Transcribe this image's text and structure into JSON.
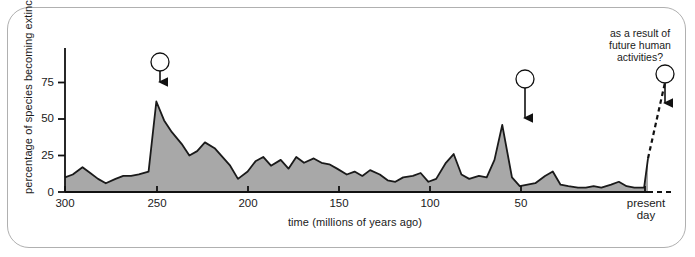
{
  "figure": {
    "border_color": "#b0b0b0"
  },
  "axes": {
    "ylabel": "percentage of species becoming extinct",
    "xlabel": "time (millions of years ago)",
    "yticks": [
      "0",
      "25",
      "50",
      "75"
    ],
    "xticks": [
      "300",
      "250",
      "200",
      "150",
      "100",
      "50"
    ],
    "x_end_label_line1": "present",
    "x_end_label_line2": "day"
  },
  "annotations": {
    "future_note_line1": "as a result of",
    "future_note_line2": "future human",
    "future_note_line3": "activities?",
    "marker1": "1",
    "marker2": "2",
    "marker3": "3"
  },
  "chart_data": {
    "type": "area",
    "title": "",
    "xlabel": "time (millions of years ago)",
    "ylabel": "percentage of species becoming extinct",
    "xlim": [
      300,
      0
    ],
    "ylim": [
      0,
      88
    ],
    "grid": false,
    "legend": "none",
    "x_axis_direction": "reversed",
    "fill_color": "#a8a8a8",
    "line_color": "#1a1a1a",
    "yticks": [
      0,
      25,
      50,
      75
    ],
    "xticks": [
      300,
      250,
      200,
      150,
      100,
      50
    ],
    "series": [
      {
        "name": "percentage of species becoming extinct",
        "x": [
          300,
          296,
          291,
          287,
          283,
          279,
          274,
          270,
          266,
          262,
          257,
          253,
          249,
          245,
          240,
          236,
          232,
          228,
          223,
          219,
          215,
          211,
          206,
          202,
          198,
          194,
          189,
          185,
          181,
          177,
          172,
          168,
          164,
          160,
          155,
          151,
          147,
          143,
          138,
          134,
          130,
          126,
          121,
          117,
          113,
          109,
          104,
          100,
          96,
          92,
          87,
          83,
          79,
          75,
          70,
          66,
          62,
          58,
          53,
          49,
          45,
          41,
          36,
          32,
          28,
          24,
          19,
          15,
          11,
          7,
          2,
          0
        ],
        "y": [
          10,
          12,
          17,
          13,
          9,
          6,
          9,
          11,
          11,
          12,
          14,
          62,
          49,
          41,
          33,
          25,
          28,
          34,
          30,
          24,
          18,
          9,
          14,
          21,
          24,
          18,
          22,
          16,
          24,
          20,
          23,
          20,
          19,
          16,
          12,
          14,
          11,
          15,
          12,
          8,
          7,
          10,
          11,
          13,
          7,
          9,
          20,
          26,
          12,
          9,
          11,
          10,
          22,
          46,
          10,
          4,
          5,
          6,
          11,
          14,
          5,
          4,
          3,
          3,
          4,
          3,
          5,
          7,
          4,
          3,
          3,
          23
        ]
      }
    ],
    "projection": {
      "name": "future projection (dashed)",
      "x": [
        0,
        -8
      ],
      "y": [
        23,
        75
      ],
      "style": "dashed"
    },
    "callouts": [
      {
        "label": "1",
        "x": 253,
        "y": 62,
        "note": "mass extinction event"
      },
      {
        "label": "2",
        "x": 75,
        "y": 46,
        "note": "mass extinction event"
      },
      {
        "label": "3",
        "x": -8,
        "y": 75,
        "note": "as a result of future human activities?"
      }
    ]
  }
}
